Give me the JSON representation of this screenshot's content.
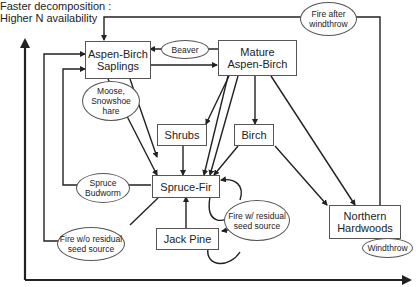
{
  "axis": {
    "y_label_line1": "Faster decomposition :",
    "y_label_line2": "Higher N availability"
  },
  "nodes": {
    "aspen_birch_saplings": "Aspen-Birch\nSaplings",
    "mature_aspen_birch": "Mature\nAspen-Birch",
    "shrubs": "Shrubs",
    "birch": "Birch",
    "spruce_fir": "Spruce-Fir",
    "jack_pine": "Jack Pine",
    "northern_hardwoods": "Northern\nHardwoods"
  },
  "disturbances": {
    "beaver": "Beaver",
    "fire_after_windthrow": "Fire after\nwindthrow",
    "moose_snowshoe_hare": "Moose,\nSnowshoe\nhare",
    "spruce_budworm": "Spruce\nBudworm",
    "fire_with_residual_seed": "Fire w/ residual\nseed source",
    "fire_without_residual_seed": "Fire w/o residual\nseed source",
    "windthrow": "Windthrow"
  },
  "colors": {
    "line": "#222222",
    "box_border": "#555555",
    "background": "#ffffff"
  }
}
